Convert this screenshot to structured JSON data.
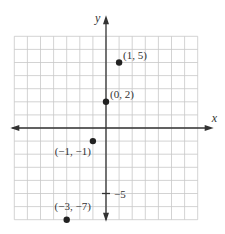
{
  "chart_data": {
    "type": "scatter",
    "title": "",
    "xlabel": "x",
    "ylabel": "y",
    "xlim": [
      -7,
      7
    ],
    "ylim": [
      -7,
      7
    ],
    "grid": true,
    "tick_labels": [
      {
        "axis": "y",
        "value": -5,
        "label": "−5"
      }
    ],
    "points": [
      {
        "x": 1,
        "y": 5,
        "label": "(1, 5)"
      },
      {
        "x": 0,
        "y": 2,
        "label": "(0, 2)"
      },
      {
        "x": -1,
        "y": -1,
        "label": "(−1, −1)"
      },
      {
        "x": -3,
        "y": -7,
        "label": "(−3, −7)"
      }
    ]
  }
}
